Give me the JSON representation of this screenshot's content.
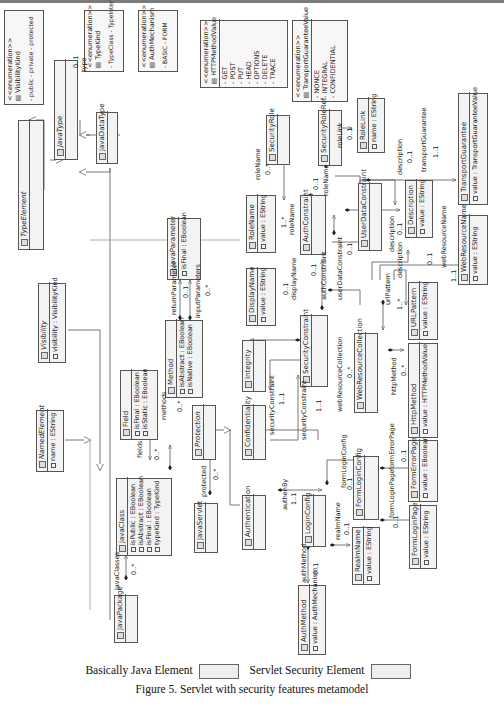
{
  "figure": {
    "caption": "Figure 5. Servlet with security features metamodel",
    "legend": [
      {
        "label": "Basically Java Element",
        "color": "#eeeeee"
      },
      {
        "label": "Servlet Security Element",
        "color": "#eeeeee"
      }
    ]
  },
  "enumerations": {
    "VisibilityKind": {
      "stereotype": "<<enumeration>>",
      "name": "VisibilityKind",
      "literals": [
        "public",
        "private",
        "protected",
        "package"
      ]
    },
    "TypeKind": {
      "stereotype": "<<enumeration>>",
      "name": "TypeKind",
      "literals": [
        "TypeClass",
        "TypeInterface",
        "TypeException"
      ]
    },
    "AuthMechanism": {
      "stereotype": "<<enumeration>>",
      "name": "AuthMechanism",
      "literals": [
        "BASIC",
        "FORM",
        "DIGEST",
        "CLIENTCERT"
      ]
    },
    "HTTPMethodValue": {
      "stereotype": "<<enumeration>>",
      "name": "HTTPMethodValue",
      "literals": [
        "GET",
        "POST",
        "PUT",
        "HEAD",
        "OPTIONS",
        "DELETE",
        "TRACE"
      ]
    },
    "TransportGuaranteeValue": {
      "stereotype": "<<enumeration>>",
      "name": "TransportGuaranteeValue",
      "literals": [
        "NONCE",
        "INTEGRAL",
        "CONFIDENTIAL"
      ]
    }
  },
  "classes": {
    "TypeElement": {
      "name": "TypeElement",
      "abstract": true,
      "attrs": []
    },
    "JavaType": {
      "name": "JavaType",
      "abstract": true,
      "attrs": []
    },
    "JavaDataType": {
      "name": "JavaDataType",
      "abstract": false,
      "attrs": []
    },
    "Visibility": {
      "name": "Visibility",
      "abstract": true,
      "attrs": [
        "visibility : VisibilityKind"
      ]
    },
    "NamedElement": {
      "name": "NamedElement",
      "abstract": true,
      "attrs": [
        "name : EString"
      ]
    },
    "Field": {
      "name": "Field",
      "attrs": [
        "isFinal : EBoolean",
        "isStatic : EBoolean"
      ]
    },
    "Method": {
      "name": "Method",
      "attrs": [
        "isAbstract : EBoolean",
        "isNative : EBoolean"
      ]
    },
    "JavaParameter": {
      "name": "JavaParameter",
      "attrs": [
        "isFinal : EBoolean"
      ]
    },
    "JavaClass": {
      "name": "JavaClass",
      "attrs": [
        "isPublic : EBoolean",
        "isAbstract : EBoolean",
        "isFinal : EBoolean",
        "typeKind : TypeKind"
      ]
    },
    "JavaPackage": {
      "name": "JavaPackage",
      "attrs": []
    },
    "Protection": {
      "name": "Protection",
      "abstract": true,
      "attrs": []
    },
    "JavaServlet": {
      "name": "JavaServlet",
      "attrs": []
    },
    "Integrity": {
      "name": "Integrity",
      "attrs": []
    },
    "Confidentiality": {
      "name": "Confidentiality",
      "attrs": []
    },
    "Authentication": {
      "name": "Authentication",
      "attrs": []
    },
    "SecurityRole": {
      "name": "SecurityRole",
      "attrs": []
    },
    "RoleName": {
      "name": "RoleName",
      "attrs": [
        "value : EString"
      ]
    },
    "DisplayName": {
      "name": "DisplayName",
      "attrs": [
        "value : EString"
      ]
    },
    "SecurityConstraint": {
      "name": "SecurityConstraint",
      "attrs": []
    },
    "AuthConstraint": {
      "name": "AuthConstraint",
      "attrs": []
    },
    "SecurityRoleRef": {
      "name": "SecurityRoleRef",
      "attrs": []
    },
    "RoleLink": {
      "name": "RoleLink",
      "attrs": [
        "name : EString"
      ]
    },
    "UserDataConstraint": {
      "name": "UserDataConstraint",
      "attrs": []
    },
    "Description": {
      "name": "Description",
      "attrs": [
        "value : EString"
      ]
    },
    "TransportGuarantee": {
      "name": "TransportGuarantee",
      "attrs": [
        "value : TransportGuaranteeValue"
      ]
    },
    "WebResourceName": {
      "name": "WebResourceName",
      "attrs": [
        "value : EString"
      ]
    },
    "WebResourceCollection": {
      "name": "WebResourceCollection",
      "attrs": []
    },
    "URLPattern": {
      "name": "URLPattern",
      "attrs": [
        "value : EString"
      ]
    },
    "HttpMethod": {
      "name": "HttpMethod",
      "attrs": [
        "value : HTTPMethodValue"
      ]
    },
    "LoginConfig": {
      "name": "LoginConfig",
      "attrs": []
    },
    "FormLoginConfig": {
      "name": "FormLoginConfig",
      "attrs": []
    },
    "FormErrorPage": {
      "name": "FormErrorPage",
      "attrs": [
        "value : EBoolean"
      ]
    },
    "FormLoginPage": {
      "name": "FormLoginPage",
      "attrs": [
        "value : EString"
      ]
    },
    "RealmName": {
      "name": "RealmName",
      "attrs": [
        "value : EString"
      ]
    },
    "AuthMethod": {
      "name": "AuthMethod",
      "attrs": [
        "value : AuthMechanism"
      ]
    }
  },
  "associations": {
    "type": {
      "role": "type",
      "mult": "0..1"
    },
    "fields": {
      "role": "fields",
      "mult": "0..*"
    },
    "methods": {
      "role": "methods",
      "mult": "0..*"
    },
    "returnParameter": {
      "role": "returnParameter",
      "mult": "0..1"
    },
    "inputParameters": {
      "role": "inputParameters",
      "mult": "0..*"
    },
    "javaClasses": {
      "role": "javaClasses",
      "mult": "0..*"
    },
    "protected": {
      "role": "protected",
      "mult": "0..*"
    },
    "authenBy": {
      "role": "authenBy",
      "mult": "1..1"
    },
    "securityConstraint1": {
      "role": "securityConstraint",
      "mult": "1..1"
    },
    "securityConstraint2": {
      "role": "securityConstraint",
      "mult": "1..1"
    },
    "displayName": {
      "role": "displayName",
      "mult": "0..1"
    },
    "roleName1": {
      "role": "roleName",
      "mult": "0..*"
    },
    "roleName2": {
      "role": "roleName",
      "mult": "1..*"
    },
    "roleName3": {
      "role": "roleName",
      "mult": "0..1"
    },
    "authConstraint": {
      "role": "authConstraint",
      "mult": "0..1"
    },
    "userDataConstraint": {
      "role": "userDataConstraint",
      "mult": "0..1"
    },
    "roleLink": {
      "role": "roleLink",
      "mult": "0..1"
    },
    "description1": {
      "role": "description",
      "mult": "0..1"
    },
    "description2": {
      "role": "description",
      "mult": "0..1"
    },
    "description3": {
      "role": "description",
      "mult": "0..1"
    },
    "transportGuarantee": {
      "role": "transportGuarantee",
      "mult": "1..1"
    },
    "webResourceName": {
      "role": "webResourceName",
      "mult": "1..1"
    },
    "webResourceCollection": {
      "role": "webResourceCollection",
      "mult": "0..*"
    },
    "urlPattern": {
      "role": "urlPattern",
      "mult": "1..*"
    },
    "httpMethod": {
      "role": "httpMethod",
      "mult": "0..*"
    },
    "formLoginConfig": {
      "role": "formLoginConfig",
      "mult": "0..1"
    },
    "formErrorPage": {
      "role": "formErrorPage",
      "mult": "0..1"
    },
    "formLoginPage": {
      "role": "formLoginPage",
      "mult": "0..1"
    },
    "realmName": {
      "role": "realmName",
      "mult": "0..1"
    },
    "authMethod": {
      "role": "authMethod",
      "mult": "0..1"
    }
  }
}
